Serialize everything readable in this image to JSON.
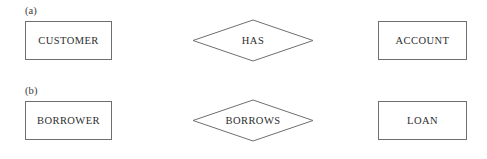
{
  "figure": {
    "background_color": "#ffffff",
    "line_color": "#6f6f6f",
    "text_color": "#2d2d2d"
  },
  "parts": [
    {
      "label": "(a)",
      "left_entity": "CUSTOMER",
      "relationship": "HAS",
      "right_entity": "ACCOUNT"
    },
    {
      "label": "(b)",
      "left_entity": "BORROWER",
      "relationship": "BORROWS",
      "right_entity": "LOAN"
    }
  ]
}
